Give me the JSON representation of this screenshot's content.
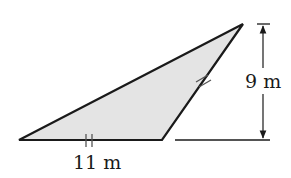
{
  "figure": {
    "type": "triangle",
    "fill_color": "#e4e4e4",
    "stroke_color": "#1a1a1a",
    "base_label": "11 m",
    "height_label": "9 m",
    "congruence_marks": "double tick marks on base and right side (equal lengths)"
  }
}
